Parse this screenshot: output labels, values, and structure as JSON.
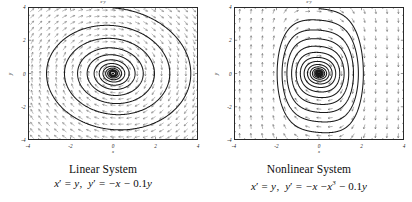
{
  "figure": {
    "background": "#ffffff",
    "ink": "#111111"
  },
  "panels": [
    {
      "id": "linear",
      "plot_title": "x-y",
      "caption_title": "Linear System",
      "equation_plain": "x' = y,  y' = -x - 0.1y",
      "equation_parts": {
        "x_prime": "x",
        "prime": "′",
        "eq": "=",
        "rhs1": "y",
        "comma": ",",
        "y_prime": "y",
        "rhs2_minus": "−",
        "rhs2_x": "x",
        "rhs2_minus2": "−",
        "rhs2_coef": "0.1",
        "rhs2_y": "y"
      },
      "axes": {
        "xlabel": "x",
        "ylabel": "y",
        "xticks": [
          "-4",
          "-2",
          "0",
          "2",
          "4"
        ],
        "xtick_values": [
          -4,
          -2,
          0,
          2,
          4
        ],
        "yticks": [
          "4",
          "2",
          "0",
          "-2",
          "-4"
        ],
        "ytick_values": [
          4,
          2,
          0,
          -2,
          -4
        ],
        "xlim": [
          -4,
          4
        ],
        "ylim": [
          -4,
          4
        ],
        "minor_ticks_per_interval": 4,
        "grid": false
      }
    },
    {
      "id": "nonlinear",
      "plot_title": "x-y",
      "caption_title": "Nonlinear System",
      "equation_plain": "x' = y,  y' = -x - x^3 - 0.1y",
      "equation_parts": {
        "x_prime": "x",
        "prime": "′",
        "eq": "=",
        "rhs1": "y",
        "comma": ",",
        "y_prime": "y",
        "rhs2_minus": "−",
        "rhs2_x": "x",
        "rhs2_minus2": "−",
        "rhs2_cubic": "x",
        "rhs2_exp": "3",
        "rhs2_minus3": "−",
        "rhs2_coef": "0.1",
        "rhs2_y": "y"
      },
      "axes": {
        "xlabel": "x",
        "ylabel": "y",
        "xticks": [
          "-4",
          "-2",
          "0",
          "2",
          "4"
        ],
        "xtick_values": [
          -4,
          -2,
          0,
          2,
          4
        ],
        "yticks": [
          "4",
          "2",
          "0",
          "-2",
          "-4"
        ],
        "ytick_values": [
          4,
          2,
          0,
          -2,
          -4
        ],
        "xlim": [
          -4,
          4
        ],
        "ylim": [
          -4,
          4
        ],
        "minor_ticks_per_interval": 4,
        "grid": false
      }
    }
  ],
  "chart_data": [
    {
      "type": "line",
      "subtype": "phase-portrait-with-vector-field",
      "title": "x-y",
      "caption": "Linear System",
      "equation": "x' = y, y' = -x - 0.1y",
      "xlabel": "x",
      "ylabel": "y",
      "xlim": [
        -4,
        4
      ],
      "ylim": [
        -4,
        4
      ],
      "xticks": [
        -4,
        -2,
        0,
        2,
        4
      ],
      "yticks": [
        -4,
        -2,
        0,
        2,
        4
      ],
      "grid": false,
      "legend": null,
      "fixed_point": {
        "x": 0,
        "y": 0,
        "type": "stable-spiral"
      },
      "vector_field": {
        "description": "uniform grid of direction arrows, u = y, v = -x - 0.1y",
        "nx": 21,
        "ny": 21,
        "arrow_length_px": 5.0,
        "color": "#666666"
      },
      "trajectory": {
        "description": "single inward spiral from near (3.8, 1.6) decaying to origin",
        "damping": 0.1,
        "turns": 9,
        "r_start": 3.95,
        "r_end": 0.12,
        "aspect": 1.0,
        "color": "#1a1a1a",
        "linewidth_px": 1.05,
        "arrow_markers": 0
      }
    },
    {
      "type": "line",
      "subtype": "phase-portrait-with-vector-field",
      "title": "x-y",
      "caption": "Nonlinear System",
      "equation": "x' = y, y' = -x - x^3 - 0.1y",
      "xlabel": "x",
      "ylabel": "y",
      "xlim": [
        -4,
        4
      ],
      "ylim": [
        -4,
        4
      ],
      "xticks": [
        -4,
        -2,
        0,
        2,
        4
      ],
      "yticks": [
        -4,
        -2,
        0,
        2,
        4
      ],
      "grid": false,
      "legend": null,
      "fixed_point": {
        "x": 0,
        "y": 0,
        "type": "stable-spiral"
      },
      "vector_field": {
        "description": "uniform grid of direction arrows, u = y, v = -x - x^3 - 0.1y; arrows nearly vertical away from x=0",
        "nx": 15,
        "ny": 15,
        "arrow_length_px": 4.6,
        "color": "#555555"
      },
      "trajectory": {
        "description": "inward spiral, orbits are tall narrow rounded rectangles (superelliptic) due to cubic stiffening",
        "damping": 0.1,
        "turns": 9,
        "r_start": 3.9,
        "r_end": 0.1,
        "x_halfwidth_outer": 2.05,
        "y_halfheight_outer": 3.75,
        "superellipse_exponent": 3.0,
        "color": "#1a1a1a",
        "linewidth_px": 1.05
      }
    }
  ]
}
